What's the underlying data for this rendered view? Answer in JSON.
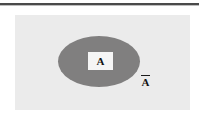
{
  "figure": {
    "type": "venn-diagram",
    "background_color": "#ffffff"
  },
  "top_rule": {
    "color": "#4a4a4a",
    "shadow_color": "#bdbdbd"
  },
  "universe": {
    "name": "universal-set",
    "fill_color": "#ebebeb",
    "label": ""
  },
  "set_a": {
    "name": "set-a",
    "label": "A",
    "fill_color": "#807f7f",
    "label_plate_color": "#f5f5f5",
    "label_text_color": "#141414"
  },
  "complement": {
    "name": "complement-of-a",
    "label": "A",
    "notation": "Ā",
    "overbar": true,
    "label_text_color": "#141414"
  }
}
